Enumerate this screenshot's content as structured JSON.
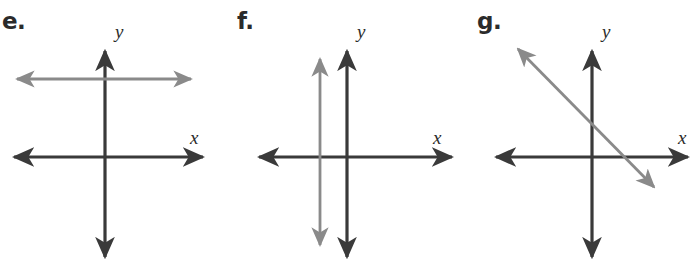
{
  "figure": {
    "width": 692,
    "height": 273,
    "background": "#ffffff",
    "axis_color": "#3a3a3a",
    "line_color": "#8a8a8a",
    "label_color": "#2b2b2b"
  },
  "panels": [
    {
      "id": "panel-e",
      "label": "e.",
      "label_x": 2,
      "label_y": 10,
      "origin_x": 105,
      "origin_y": 157,
      "x_axis_label": "x",
      "x_label_x": 190,
      "x_label_y": 128,
      "y_axis_label": "y",
      "y_label_x": 115,
      "y_label_y": 22,
      "x_axis": {
        "x1": 10,
        "y1": 157,
        "x2": 207,
        "y2": 157
      },
      "y_axis": {
        "x1": 105,
        "y1": 46,
        "x2": 105,
        "y2": 262
      },
      "drawn_line": {
        "name": "horizontal-gray-line",
        "kind": "horizontal",
        "x1": 12,
        "y1": 79,
        "x2": 196,
        "y2": 79,
        "color": "#8a8a8a"
      }
    },
    {
      "id": "panel-f",
      "label": "f.",
      "label_x": 237,
      "label_y": 10,
      "origin_x": 347,
      "origin_y": 157,
      "x_axis_label": "x",
      "x_label_x": 433,
      "x_label_y": 128,
      "y_axis_label": "y",
      "y_label_x": 357,
      "y_label_y": 22,
      "x_axis": {
        "x1": 255,
        "y1": 157,
        "x2": 457,
        "y2": 157
      },
      "y_axis": {
        "x1": 347,
        "y1": 46,
        "x2": 347,
        "y2": 262
      },
      "drawn_line": {
        "name": "vertical-gray-line",
        "kind": "vertical",
        "x1": 320,
        "y1": 54,
        "x2": 320,
        "y2": 250,
        "color": "#8a8a8a"
      }
    },
    {
      "id": "panel-g",
      "label": "g.",
      "label_x": 477,
      "label_y": 10,
      "origin_x": 592,
      "origin_y": 157,
      "x_axis_label": "x",
      "x_label_x": 678,
      "x_label_y": 128,
      "y_axis_label": "y",
      "y_label_x": 602,
      "y_label_y": 22,
      "x_axis": {
        "x1": 492,
        "y1": 157,
        "x2": 690,
        "y2": 157
      },
      "y_axis": {
        "x1": 592,
        "y1": 46,
        "x2": 592,
        "y2": 262
      },
      "drawn_line": {
        "name": "diagonal-gray-line",
        "kind": "diagonal-negative-slope",
        "x1": 514,
        "y1": 106,
        "x2": 652,
        "y2": 246,
        "color": "#8a8a8a"
      }
    }
  ]
}
